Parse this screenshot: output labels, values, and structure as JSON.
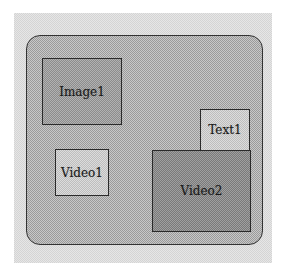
{
  "diagram": {
    "type": "layout-regions",
    "colors": {
      "stage_background": "#e6e6e6",
      "container_fill": "#bfbfbf",
      "container_border": "#333333",
      "region_border": "#2a2a2a",
      "medium_fill": "#a8a8a8",
      "light_fill": "#d8d8d8",
      "dark_fill": "#959595"
    },
    "regions": [
      {
        "id": "image1",
        "label": "Image1",
        "shade": "medium",
        "x": 42,
        "y": 58,
        "width": 80,
        "height": 67
      },
      {
        "id": "video1",
        "label": "Video1",
        "shade": "light",
        "x": 55,
        "y": 149,
        "width": 54,
        "height": 47
      },
      {
        "id": "text1",
        "label": "Text1",
        "shade": "light",
        "x": 200,
        "y": 109,
        "width": 50,
        "height": 42
      },
      {
        "id": "video2",
        "label": "Video2",
        "shade": "dark",
        "x": 152,
        "y": 150,
        "width": 99,
        "height": 82
      }
    ]
  }
}
